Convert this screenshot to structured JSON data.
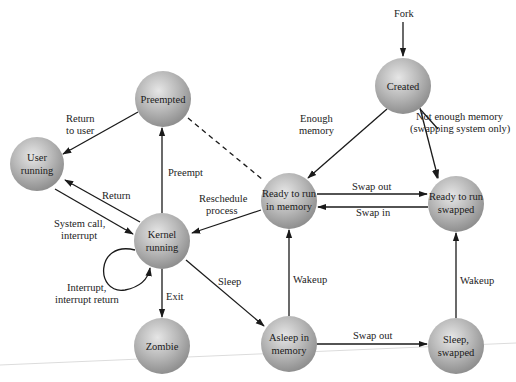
{
  "diagram": {
    "type": "state-transition",
    "node_color": "#b5b5b5",
    "nodes": [
      {
        "id": "preempted",
        "label_lines": [
          "Preempted"
        ],
        "cx": 163,
        "cy": 99
      },
      {
        "id": "created",
        "label_lines": [
          "Created"
        ],
        "cx": 403,
        "cy": 86
      },
      {
        "id": "user_running",
        "label_lines": [
          "User",
          "running"
        ],
        "cx": 37,
        "cy": 164
      },
      {
        "id": "kernel_running",
        "label_lines": [
          "Kernel",
          "running"
        ],
        "cx": 162,
        "cy": 241
      },
      {
        "id": "ready_mem",
        "label_lines": [
          "Ready to run",
          "in memory"
        ],
        "cx": 289,
        "cy": 201
      },
      {
        "id": "ready_swapped",
        "label_lines": [
          "Ready to run",
          "swapped"
        ],
        "cx": 456,
        "cy": 204
      },
      {
        "id": "zombie",
        "label_lines": [
          "Zombie"
        ],
        "cx": 162,
        "cy": 346
      },
      {
        "id": "asleep_mem",
        "label_lines": [
          "Asleep in",
          "memory"
        ],
        "cx": 289,
        "cy": 344
      },
      {
        "id": "sleep_swapped",
        "label_lines": [
          "Sleep,",
          "swapped"
        ],
        "cx": 456,
        "cy": 346
      }
    ],
    "edges": [
      {
        "from": "fork",
        "to": "created",
        "label": "Fork"
      },
      {
        "from": "created",
        "to": "ready_mem",
        "label_lines": [
          "Enough",
          "memory"
        ]
      },
      {
        "from": "created",
        "to": "ready_swapped",
        "label_lines": [
          "Not enough memory",
          "(swapping system only)"
        ]
      },
      {
        "from": "ready_mem",
        "to": "ready_swapped",
        "label": "Swap out"
      },
      {
        "from": "ready_swapped",
        "to": "ready_mem",
        "label": "Swap in"
      },
      {
        "from": "preempted",
        "to": "user_running",
        "label_lines": [
          "Return",
          "to user"
        ]
      },
      {
        "from": "kernel_running",
        "to": "preempted",
        "label": "Preempt"
      },
      {
        "from": "preempted",
        "to": "ready_mem",
        "style": "dashed"
      },
      {
        "from": "kernel_running",
        "to": "user_running",
        "label": "Return"
      },
      {
        "from": "user_running",
        "to": "kernel_running",
        "label_lines": [
          "System call,",
          "interrupt"
        ]
      },
      {
        "from": "ready_mem",
        "to": "kernel_running",
        "label_lines": [
          "Reschedule",
          "process"
        ]
      },
      {
        "from": "kernel_running",
        "to": "kernel_running",
        "label_lines": [
          "Interrupt,",
          "interrupt return"
        ]
      },
      {
        "from": "kernel_running",
        "to": "zombie",
        "label": "Exit"
      },
      {
        "from": "kernel_running",
        "to": "asleep_mem",
        "label": "Sleep"
      },
      {
        "from": "asleep_mem",
        "to": "ready_mem",
        "label": "Wakeup"
      },
      {
        "from": "asleep_mem",
        "to": "sleep_swapped",
        "label": "Swap out"
      },
      {
        "from": "sleep_swapped",
        "to": "ready_swapped",
        "label": "Wakeup"
      }
    ]
  },
  "labels": {
    "fork": "Fork",
    "enough_1": "Enough",
    "enough_2": "memory",
    "notenough_1": "Not enough memory",
    "notenough_2": "(swapping system only)",
    "return_to_user_1": "Return",
    "return_to_user_2": "to user",
    "preempt": "Preempt",
    "return": "Return",
    "syscall_1": "System call,",
    "syscall_2": "interrupt",
    "reschedule_1": "Reschedule",
    "reschedule_2": "process",
    "swap_out_top": "Swap out",
    "swap_in": "Swap in",
    "interrupt_1": "Interrupt,",
    "interrupt_2": "interrupt return",
    "exit": "Exit",
    "sleep": "Sleep",
    "wakeup_left": "Wakeup",
    "wakeup_right": "Wakeup",
    "swap_out_bottom": "Swap out"
  },
  "nodes": {
    "preempted": "Preempted",
    "created": "Created",
    "user_1": "User",
    "user_2": "running",
    "kernel_1": "Kernel",
    "kernel_2": "running",
    "ready_mem_1": "Ready to run",
    "ready_mem_2": "in memory",
    "ready_sw_1": "Ready to run",
    "ready_sw_2": "swapped",
    "zombie": "Zombie",
    "asleep_1": "Asleep in",
    "asleep_2": "memory",
    "sleep_sw_1": "Sleep,",
    "sleep_sw_2": "swapped"
  }
}
